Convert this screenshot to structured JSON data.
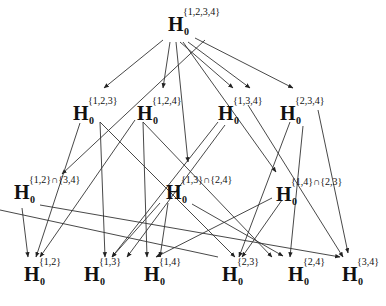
{
  "diagram": {
    "type": "closed-testing-hypothesis-graph",
    "symbol": "H",
    "subscript": "0",
    "nodes": [
      {
        "id": "n1234",
        "label": "{1,2,3,4}",
        "x": 168,
        "y": 14
      },
      {
        "id": "n123",
        "label": "{1,2,3}",
        "x": 73,
        "y": 103
      },
      {
        "id": "n124",
        "label": "{1,2,4}",
        "x": 137,
        "y": 103
      },
      {
        "id": "n134",
        "label": "{1,3,4}",
        "x": 218,
        "y": 103
      },
      {
        "id": "n234",
        "label": "{2,3,4}",
        "x": 280,
        "y": 103
      },
      {
        "id": "n12_34",
        "label": "{1,2}∩{3,4}",
        "x": 14,
        "y": 182
      },
      {
        "id": "n13_24",
        "label": "{1,3}∩{2,4}",
        "x": 166,
        "y": 182
      },
      {
        "id": "n14_23",
        "label": "{1,4}∩{2,3}",
        "x": 276,
        "y": 184
      },
      {
        "id": "n12",
        "label": "{1,2}",
        "x": 24,
        "y": 264
      },
      {
        "id": "n13",
        "label": "{1,3}",
        "x": 84,
        "y": 264
      },
      {
        "id": "n14",
        "label": "{1,4}",
        "x": 144,
        "y": 264
      },
      {
        "id": "n23",
        "label": "{2,3}",
        "x": 222,
        "y": 264
      },
      {
        "id": "n24",
        "label": "{2,4}",
        "x": 288,
        "y": 264
      },
      {
        "id": "n34",
        "label": "{3,4}",
        "x": 342,
        "y": 264
      }
    ],
    "edges": [
      {
        "from": [
          163,
          40
        ],
        "to": [
          104,
          88
        ]
      },
      {
        "from": [
          170,
          42
        ],
        "to": [
          163,
          88
        ]
      },
      {
        "from": [
          180,
          42
        ],
        "to": [
          233,
          88
        ]
      },
      {
        "from": [
          188,
          42
        ],
        "to": [
          250,
          88
        ]
      },
      {
        "from": [
          195,
          38
        ],
        "to": [
          293,
          88
        ]
      },
      {
        "from": [
          176,
          42
        ],
        "to": [
          188,
          162
        ]
      },
      {
        "from": [
          183,
          42
        ],
        "to": [
          276,
          172
        ]
      },
      {
        "from": [
          205,
          40
        ],
        "to": [
          62,
          174
        ]
      },
      {
        "from": [
          80,
          123
        ],
        "to": [
          36,
          257
        ]
      },
      {
        "from": [
          100,
          122
        ],
        "to": [
          105,
          257
        ]
      },
      {
        "from": [
          100,
          122
        ],
        "to": [
          235,
          257
        ]
      },
      {
        "from": [
          135,
          120
        ],
        "to": [
          40,
          257
        ]
      },
      {
        "from": [
          143,
          122
        ],
        "to": [
          147,
          257
        ]
      },
      {
        "from": [
          143,
          122
        ],
        "to": [
          272,
          257
        ]
      },
      {
        "from": [
          218,
          122
        ],
        "to": [
          112,
          257
        ]
      },
      {
        "from": [
          225,
          125
        ],
        "to": [
          127,
          257
        ]
      },
      {
        "from": [
          248,
          105
        ],
        "to": [
          343,
          257
        ]
      },
      {
        "from": [
          290,
          122
        ],
        "to": [
          239,
          257
        ]
      },
      {
        "from": [
          303,
          126
        ],
        "to": [
          290,
          257
        ]
      },
      {
        "from": [
          318,
          110
        ],
        "to": [
          348,
          253
        ]
      },
      {
        "from": [
          22,
          208
        ],
        "to": [
          28,
          257
        ]
      },
      {
        "from": [
          40,
          205
        ],
        "to": [
          340,
          257
        ]
      },
      {
        "from": [
          160,
          203
        ],
        "to": [
          112,
          257
        ]
      },
      {
        "from": [
          168,
          203
        ],
        "to": [
          160,
          257
        ]
      },
      {
        "from": [
          192,
          204
        ],
        "to": [
          283,
          256
        ]
      },
      {
        "from": [
          272,
          198
        ],
        "to": [
          156,
          257
        ]
      },
      {
        "from": [
          282,
          200
        ],
        "to": [
          242,
          257
        ]
      },
      {
        "from": [
          0,
          210
        ],
        "to": [
          218,
          257
        ]
      },
      {
        "from": [
          28,
          100
        ],
        "to": [
          0,
          100
        ]
      }
    ],
    "colors": {
      "line": "#333333",
      "text": "#111111",
      "background": "#ffffff"
    }
  }
}
